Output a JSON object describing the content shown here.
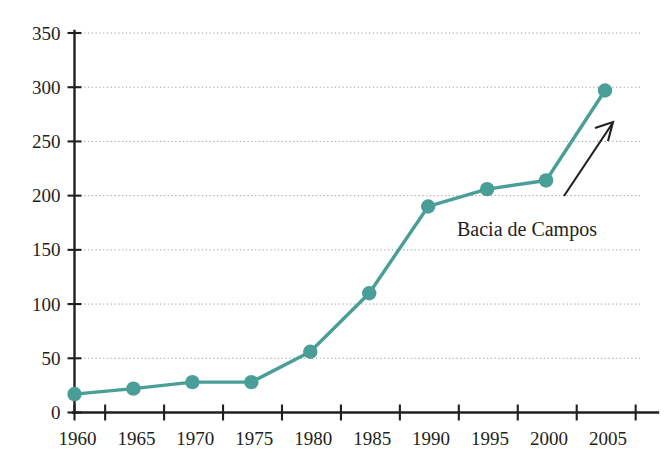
{
  "chart_data": {
    "type": "line",
    "title": "",
    "subtitle": "",
    "xlabel": "",
    "ylabel": "",
    "x": [
      1960,
      1965,
      1970,
      1975,
      1980,
      1985,
      1990,
      1995,
      2000,
      2005
    ],
    "categories": [
      "1960",
      "1965",
      "1970",
      "1975",
      "1980",
      "1985",
      "1990",
      "1995",
      "2000",
      "2005"
    ],
    "values": [
      17,
      22,
      28,
      28,
      56,
      110,
      190,
      206,
      214,
      297
    ],
    "series": [
      {
        "name": "Bacia de Campos",
        "values": [
          17,
          22,
          28,
          28,
          56,
          110,
          190,
          206,
          214,
          297
        ],
        "color": "#4a9e98",
        "marker": "circle"
      }
    ],
    "ylim": [
      0,
      350
    ],
    "xlim": [
      1960,
      2005
    ],
    "ytick_labels": [
      "0",
      "50",
      "100",
      "150",
      "200",
      "250",
      "300",
      "350"
    ],
    "yticks": [
      0,
      50,
      100,
      150,
      200,
      250,
      300,
      350
    ],
    "xtick_labels": [
      "1960",
      "1965",
      "1970",
      "1975",
      "1980",
      "1985",
      "1990",
      "1995",
      "2000",
      "2005"
    ],
    "xticks": [
      1960,
      1965,
      1970,
      1975,
      1980,
      1985,
      1990,
      1995,
      2000,
      2005
    ],
    "grid": {
      "horizontal": true,
      "vertical": false,
      "style": "dotted",
      "color": "#9a9a9a"
    },
    "legend": {
      "visible": false,
      "position": "none"
    },
    "annotations": [
      {
        "text": "Bacia de Campos",
        "type": "arrow-label",
        "points_to": "2005",
        "color": "#231f20"
      }
    ],
    "colors": {
      "series": "#4a9e98",
      "axis": "#231f20",
      "grid": "#9a9a9a",
      "text": "#231f20",
      "background": "#ffffff"
    }
  },
  "axes": {
    "y_labels": [
      "350",
      "300",
      "250",
      "200",
      "150",
      "100",
      "50",
      "0"
    ],
    "x_labels": [
      "1960",
      "1965",
      "1970",
      "1975",
      "1980",
      "1985",
      "1990",
      "1995",
      "2000",
      "2005"
    ]
  },
  "annotation": {
    "label": "Bacia de Campos"
  }
}
